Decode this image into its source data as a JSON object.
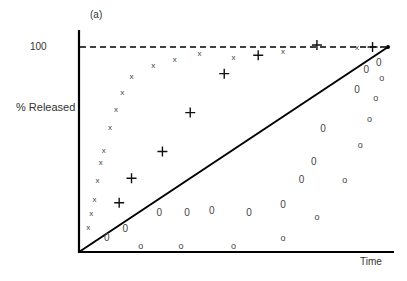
{
  "chart_data": {
    "type": "scatter",
    "title": "",
    "panel_label": "(a)",
    "xlabel": "Time",
    "ylabel": "% Released",
    "yticks": [
      "100"
    ],
    "ylim": [
      0,
      108
    ],
    "xlim": [
      0,
      1.02
    ],
    "grid": false,
    "legend": null,
    "reference_lines": [
      {
        "name": "100% plateau",
        "style": "dashed",
        "y": 100,
        "x": [
          0,
          1.0
        ]
      },
      {
        "name": "zero-order (linear) release",
        "style": "solid",
        "points": [
          [
            0,
            0
          ],
          [
            1.0,
            100
          ]
        ]
      }
    ],
    "series": [
      {
        "name": "x (fast release)",
        "marker": "x",
        "points": [
          [
            0.03,
            12
          ],
          [
            0.04,
            19
          ],
          [
            0.05,
            26
          ],
          [
            0.06,
            35
          ],
          [
            0.07,
            44
          ],
          [
            0.08,
            50
          ],
          [
            0.1,
            61
          ],
          [
            0.12,
            70
          ],
          [
            0.14,
            78
          ],
          [
            0.17,
            86
          ],
          [
            0.24,
            91
          ],
          [
            0.31,
            94
          ],
          [
            0.39,
            97
          ],
          [
            0.5,
            95
          ],
          [
            0.66,
            98
          ],
          [
            0.9,
            100
          ]
        ]
      },
      {
        "name": "+ (intermediate release)",
        "marker": "+",
        "points": [
          [
            0.13,
            24
          ],
          [
            0.17,
            36
          ],
          [
            0.27,
            49
          ],
          [
            0.36,
            68
          ],
          [
            0.47,
            87
          ],
          [
            0.58,
            96
          ],
          [
            0.77,
            101
          ],
          [
            0.95,
            100
          ]
        ]
      },
      {
        "name": "0 (below zero-order)",
        "marker": "0",
        "points": [
          [
            0.09,
            7
          ],
          [
            0.15,
            11
          ],
          [
            0.26,
            19
          ],
          [
            0.35,
            19
          ],
          [
            0.43,
            20
          ],
          [
            0.55,
            19
          ],
          [
            0.66,
            23
          ],
          [
            0.72,
            35
          ],
          [
            0.76,
            44
          ],
          [
            0.79,
            60
          ],
          [
            0.9,
            79
          ],
          [
            0.93,
            89
          ],
          [
            0.97,
            92
          ]
        ]
      },
      {
        "name": "o (slow release)",
        "marker": "o",
        "points": [
          [
            0.2,
            3
          ],
          [
            0.33,
            3
          ],
          [
            0.5,
            3
          ],
          [
            0.66,
            7
          ],
          [
            0.77,
            17
          ],
          [
            0.86,
            35
          ],
          [
            0.91,
            52
          ],
          [
            0.94,
            65
          ],
          [
            0.96,
            75
          ],
          [
            0.98,
            85
          ]
        ]
      }
    ]
  },
  "labels": {
    "panel": "(a)",
    "ytick_100": "100",
    "ylabel": "% Released",
    "xlabel": "Time"
  },
  "colors": {
    "axis": "#000000",
    "marker": "#444444",
    "text": "#333333"
  }
}
